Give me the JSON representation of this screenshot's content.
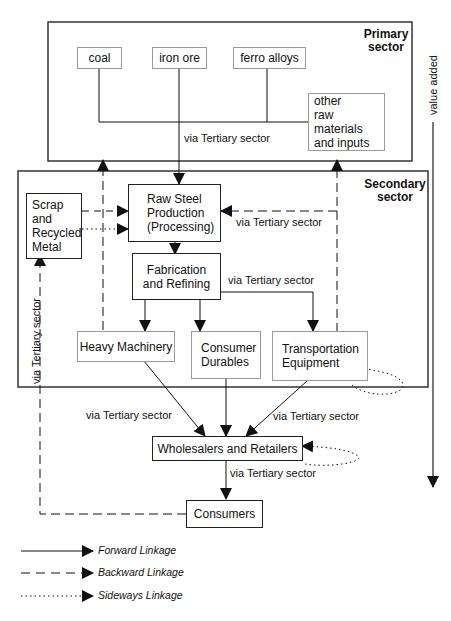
{
  "sectors": {
    "primary": "Primary\nsector",
    "primary_line1": "Primary",
    "primary_line2": "sector",
    "secondary_line1": "Secondary",
    "secondary_line2": "sector"
  },
  "nodes": {
    "coal": "coal",
    "iron_ore": "iron ore",
    "ferro_alloys": "ferro alloys",
    "other_raw_line1": "other",
    "other_raw_line2": "raw materials",
    "other_raw_line3": "and inputs",
    "raw_steel_line1": "Raw Steel",
    "raw_steel_line2": "Production",
    "raw_steel_line3": "(Processing)",
    "scrap_line1": "Scrap",
    "scrap_line2": "and",
    "scrap_line3": "Recycled",
    "scrap_line4": "Metal",
    "fabrication_line1": "Fabrication",
    "fabrication_line2": "and Refining",
    "heavy_machinery": "Heavy Machinery",
    "consumer_durables_line1": "Consumer",
    "consumer_durables_line2": "Durables",
    "transportation_line1": "Transportation",
    "transportation_line2": "Equipment",
    "wholesalers": "Wholesalers and Retailers",
    "consumers": "Consumers"
  },
  "edge_labels": {
    "primary_to_raw": "via Tertiary sector",
    "transport_to_raw": "via Tertiary sector",
    "fab_to_transport": "via Tertiary sector",
    "heavy_to_wholesale": "via Tertiary sector",
    "transport_to_wholesale": "via Tertiary sector",
    "wholesale_to_consumers": "via Tertiary sector",
    "consumers_to_scrap": "via Tertiary sector"
  },
  "axis": {
    "value_added": "value added"
  },
  "legend": {
    "forward": "Forward Linkage",
    "backward": "Backward Linkage",
    "sideways": "Sideways Linkage"
  }
}
